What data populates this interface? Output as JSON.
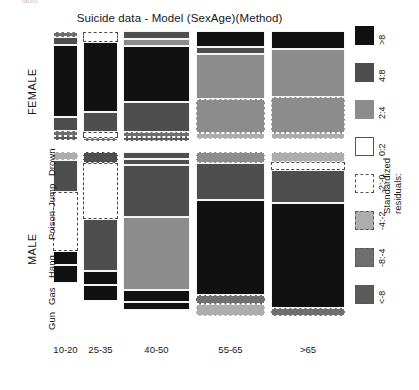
{
  "chart_data": {
    "type": "mosaic",
    "title": "Suicide data - Model (SexAge)(Method)",
    "xlabel": "",
    "ylabel": "",
    "x_categories": [
      "10-20",
      "25-35",
      "40-50",
      "55-65",
      ">65"
    ],
    "row_groups": [
      "FEMALE",
      "MALE"
    ],
    "y_categories": [
      "Drown",
      "Jump",
      "Poison",
      "Hang",
      "Gas",
      "Gun"
    ],
    "legend": {
      "title_line1": "Standardized",
      "title_line2": "residuals:",
      "entries": [
        {
          "label": ">8",
          "color": "#111111",
          "border": "solid"
        },
        {
          "label": "4:8",
          "color": "#4e4e4e",
          "border": "solid"
        },
        {
          "label": "2:4",
          "color": "#8c8c8c",
          "border": "solid"
        },
        {
          "label": "0:2",
          "color": "#ffffff",
          "border": "solid"
        },
        {
          "label": "-2:-0",
          "color": "#ffffff",
          "border": "dashed"
        },
        {
          "label": "-4:-2",
          "color": "#adadad",
          "border": "dashed"
        },
        {
          "label": "-8:-4",
          "color": "#6e6e6e",
          "border": "dashed"
        },
        {
          "label": "<-8",
          "color": "#5a5a5a",
          "border": "dashed"
        }
      ]
    },
    "cropped_text": "iaoro",
    "cells": [
      {
        "col": 0,
        "group": "FEMALE",
        "method": "Drown",
        "x": 53,
        "y": 32,
        "w": 25,
        "h": 5,
        "color": "#6e6e6e",
        "border": "dashed"
      },
      {
        "col": 0,
        "group": "FEMALE",
        "method": "Jump",
        "x": 53,
        "y": 37,
        "w": 25,
        "h": 8,
        "color": "#4e4e4e",
        "border": "solid"
      },
      {
        "col": 0,
        "group": "FEMALE",
        "method": "Poison",
        "x": 53,
        "y": 45,
        "w": 25,
        "h": 72,
        "color": "#111111",
        "border": "solid"
      },
      {
        "col": 0,
        "group": "FEMALE",
        "method": "Hang",
        "x": 53,
        "y": 117,
        "w": 25,
        "h": 14,
        "color": "#4e4e4e",
        "border": "solid"
      },
      {
        "col": 0,
        "group": "FEMALE",
        "method": "Gas",
        "x": 53,
        "y": 131,
        "w": 25,
        "h": 5,
        "color": "#6e6e6e",
        "border": "dashed"
      },
      {
        "col": 0,
        "group": "FEMALE",
        "method": "Gun",
        "x": 53,
        "y": 136,
        "w": 25,
        "h": 4,
        "color": "#5a5a5a",
        "border": "dashed"
      },
      {
        "col": 1,
        "group": "FEMALE",
        "method": "Drown",
        "x": 83,
        "y": 32,
        "w": 35,
        "h": 10,
        "color": "#ffffff",
        "border": "dashed"
      },
      {
        "col": 1,
        "group": "FEMALE",
        "method": "Poison",
        "x": 83,
        "y": 42,
        "w": 35,
        "h": 70,
        "color": "#111111",
        "border": "solid"
      },
      {
        "col": 1,
        "group": "FEMALE",
        "method": "Hang",
        "x": 83,
        "y": 112,
        "w": 35,
        "h": 20,
        "color": "#4e4e4e",
        "border": "solid"
      },
      {
        "col": 1,
        "group": "FEMALE",
        "method": "Gas",
        "x": 83,
        "y": 132,
        "w": 35,
        "h": 6,
        "color": "#ffffff",
        "border": "dashed"
      },
      {
        "col": 1,
        "group": "FEMALE",
        "method": "Gun",
        "x": 83,
        "y": 138,
        "w": 35,
        "h": 3,
        "color": "#6e6e6e",
        "border": "dashed"
      },
      {
        "col": 2,
        "group": "FEMALE",
        "method": "Drown",
        "x": 123,
        "y": 31,
        "w": 67,
        "h": 8,
        "color": "#4e4e4e",
        "border": "solid"
      },
      {
        "col": 2,
        "group": "FEMALE",
        "method": "Jump",
        "x": 123,
        "y": 39,
        "w": 67,
        "h": 7,
        "color": "#8c8c8c",
        "border": "solid"
      },
      {
        "col": 2,
        "group": "FEMALE",
        "method": "Poison",
        "x": 123,
        "y": 46,
        "w": 67,
        "h": 56,
        "color": "#111111",
        "border": "solid"
      },
      {
        "col": 2,
        "group": "FEMALE",
        "method": "Hang",
        "x": 123,
        "y": 102,
        "w": 67,
        "h": 30,
        "color": "#4e4e4e",
        "border": "solid"
      },
      {
        "col": 2,
        "group": "FEMALE",
        "method": "Gas",
        "x": 123,
        "y": 132,
        "w": 67,
        "h": 5,
        "color": "#6e6e6e",
        "border": "dashed"
      },
      {
        "col": 2,
        "group": "FEMALE",
        "method": "Gun",
        "x": 123,
        "y": 137,
        "w": 67,
        "h": 4,
        "color": "#5a5a5a",
        "border": "dashed"
      },
      {
        "col": 3,
        "group": "FEMALE",
        "method": "Drown",
        "x": 196,
        "y": 31,
        "w": 69,
        "h": 16,
        "color": "#111111",
        "border": "solid"
      },
      {
        "col": 3,
        "group": "FEMALE",
        "method": "Jump",
        "x": 196,
        "y": 47,
        "w": 69,
        "h": 7,
        "color": "#4e4e4e",
        "border": "solid"
      },
      {
        "col": 3,
        "group": "FEMALE",
        "method": "Poison",
        "x": 196,
        "y": 54,
        "w": 69,
        "h": 45,
        "color": "#8c8c8c",
        "border": "solid"
      },
      {
        "col": 3,
        "group": "FEMALE",
        "method": "Hang",
        "x": 196,
        "y": 99,
        "w": 69,
        "h": 34,
        "color": "#8c8c8c",
        "border": "dashed"
      },
      {
        "col": 3,
        "group": "FEMALE",
        "method": "Gun",
        "x": 196,
        "y": 133,
        "w": 69,
        "h": 6,
        "color": "#adadad",
        "border": "dashed"
      },
      {
        "col": 4,
        "group": "FEMALE",
        "method": "Drown",
        "x": 271,
        "y": 31,
        "w": 74,
        "h": 18,
        "color": "#111111",
        "border": "solid"
      },
      {
        "col": 4,
        "group": "FEMALE",
        "method": "Poison",
        "x": 271,
        "y": 49,
        "w": 74,
        "h": 48,
        "color": "#8c8c8c",
        "border": "solid"
      },
      {
        "col": 4,
        "group": "FEMALE",
        "method": "Hang",
        "x": 271,
        "y": 97,
        "w": 74,
        "h": 36,
        "color": "#8c8c8c",
        "border": "dashed"
      },
      {
        "col": 4,
        "group": "FEMALE",
        "method": "Gun",
        "x": 271,
        "y": 133,
        "w": 74,
        "h": 6,
        "color": "#adadad",
        "border": "dashed"
      },
      {
        "col": 0,
        "group": "MALE",
        "method": "Drown",
        "x": 53,
        "y": 152,
        "w": 25,
        "h": 8,
        "color": "#adadad",
        "border": "dashed"
      },
      {
        "col": 0,
        "group": "MALE",
        "method": "Jump",
        "x": 53,
        "y": 160,
        "w": 25,
        "h": 32,
        "color": "#4e4e4e",
        "border": "solid"
      },
      {
        "col": 0,
        "group": "MALE",
        "method": "Poison",
        "x": 53,
        "y": 192,
        "w": 25,
        "h": 59,
        "color": "#ffffff",
        "border": "dashed"
      },
      {
        "col": 0,
        "group": "MALE",
        "method": "Hang",
        "x": 53,
        "y": 251,
        "w": 25,
        "h": 14,
        "color": "#111111",
        "border": "solid"
      },
      {
        "col": 0,
        "group": "MALE",
        "method": "Gun",
        "x": 53,
        "y": 265,
        "w": 25,
        "h": 18,
        "color": "#111111",
        "border": "solid"
      },
      {
        "col": 1,
        "group": "MALE",
        "method": "Drown",
        "x": 83,
        "y": 152,
        "w": 35,
        "h": 11,
        "color": "#4e4e4e",
        "border": "dashed"
      },
      {
        "col": 1,
        "group": "MALE",
        "method": "Poison",
        "x": 83,
        "y": 163,
        "w": 35,
        "h": 56,
        "color": "#ffffff",
        "border": "dashed"
      },
      {
        "col": 1,
        "group": "MALE",
        "method": "Hang",
        "x": 83,
        "y": 219,
        "w": 35,
        "h": 52,
        "color": "#4e4e4e",
        "border": "solid"
      },
      {
        "col": 1,
        "group": "MALE",
        "method": "Gas",
        "x": 83,
        "y": 271,
        "w": 35,
        "h": 14,
        "color": "#111111",
        "border": "solid"
      },
      {
        "col": 1,
        "group": "MALE",
        "method": "Gun",
        "x": 83,
        "y": 285,
        "w": 35,
        "h": 16,
        "color": "#111111",
        "border": "solid"
      },
      {
        "col": 2,
        "group": "MALE",
        "method": "Drown",
        "x": 123,
        "y": 152,
        "w": 67,
        "h": 7,
        "color": "#4e4e4e",
        "border": "solid"
      },
      {
        "col": 2,
        "group": "MALE",
        "method": "Jump",
        "x": 123,
        "y": 159,
        "w": 67,
        "h": 6,
        "color": "#4e4e4e",
        "border": "solid"
      },
      {
        "col": 2,
        "group": "MALE",
        "method": "Poison",
        "x": 123,
        "y": 165,
        "w": 67,
        "h": 52,
        "color": "#4e4e4e",
        "border": "solid"
      },
      {
        "col": 2,
        "group": "MALE",
        "method": "Hang",
        "x": 123,
        "y": 217,
        "w": 67,
        "h": 73,
        "color": "#8c8c8c",
        "border": "solid"
      },
      {
        "col": 2,
        "group": "MALE",
        "method": "Gas",
        "x": 123,
        "y": 290,
        "w": 67,
        "h": 12,
        "color": "#111111",
        "border": "solid"
      },
      {
        "col": 2,
        "group": "MALE",
        "method": "Gun",
        "x": 123,
        "y": 302,
        "w": 67,
        "h": 8,
        "color": "#111111",
        "border": "solid"
      },
      {
        "col": 3,
        "group": "MALE",
        "method": "Drown",
        "x": 196,
        "y": 152,
        "w": 69,
        "h": 11,
        "color": "#8c8c8c",
        "border": "dashed"
      },
      {
        "col": 3,
        "group": "MALE",
        "method": "Jump",
        "x": 196,
        "y": 163,
        "w": 69,
        "h": 37,
        "color": "#4e4e4e",
        "border": "solid"
      },
      {
        "col": 3,
        "group": "MALE",
        "method": "Poison",
        "x": 196,
        "y": 200,
        "w": 69,
        "h": 95,
        "color": "#111111",
        "border": "solid"
      },
      {
        "col": 3,
        "group": "MALE",
        "method": "Hang",
        "x": 196,
        "y": 295,
        "w": 69,
        "h": 9,
        "color": "#6e6e6e",
        "border": "dashed"
      },
      {
        "col": 3,
        "group": "MALE",
        "method": "Gun",
        "x": 196,
        "y": 304,
        "w": 69,
        "h": 12,
        "color": "#adadad",
        "border": "dashed"
      },
      {
        "col": 4,
        "group": "MALE",
        "method": "Drown",
        "x": 271,
        "y": 152,
        "w": 74,
        "h": 10,
        "color": "#adadad",
        "border": "dashed"
      },
      {
        "col": 4,
        "group": "MALE",
        "method": "Jump",
        "x": 271,
        "y": 162,
        "w": 74,
        "h": 8,
        "color": "#ffffff",
        "border": "dashed"
      },
      {
        "col": 4,
        "group": "MALE",
        "method": "Poison",
        "x": 271,
        "y": 170,
        "w": 74,
        "h": 33,
        "color": "#4e4e4e",
        "border": "solid"
      },
      {
        "col": 4,
        "group": "MALE",
        "method": "Hang",
        "x": 271,
        "y": 203,
        "w": 74,
        "h": 105,
        "color": "#111111",
        "border": "solid"
      },
      {
        "col": 4,
        "group": "MALE",
        "method": "Gun",
        "x": 271,
        "y": 308,
        "w": 74,
        "h": 8,
        "color": "#6e6e6e",
        "border": "dashed"
      }
    ],
    "method_label_positions": [
      {
        "label": "Drown",
        "y": 176
      },
      {
        "label": "Jump",
        "y": 207
      },
      {
        "label": "Poison",
        "y": 240
      },
      {
        "label": "Hang",
        "y": 278
      },
      {
        "label": "Gas",
        "y": 305
      },
      {
        "label": "Gun",
        "y": 330
      }
    ],
    "sex_label_positions": [
      {
        "label": "FEMALE",
        "y": 115
      },
      {
        "label": "MALE",
        "y": 265
      }
    ]
  }
}
